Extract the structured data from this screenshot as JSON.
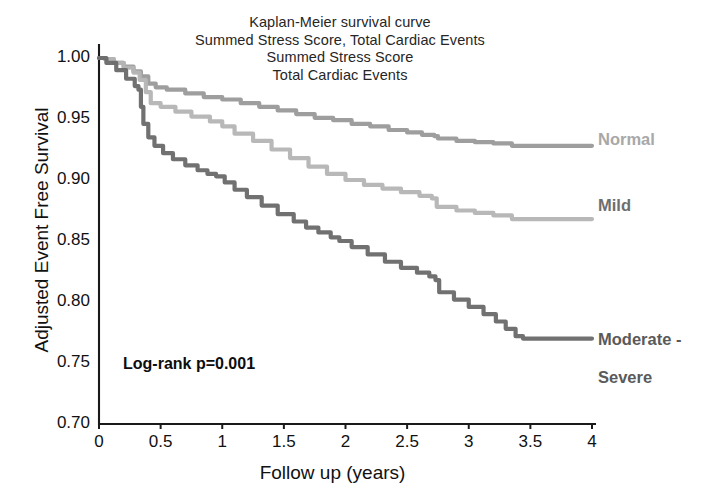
{
  "chart_data": {
    "type": "line",
    "title": "Kaplan-Meier survival curve\nSummed Stress Score, Total Cardiac Events\nSummed Stress Score\nTotal Cardiac Events",
    "title_lines": [
      "Kaplan-Meier survival curve",
      "Summed Stress Score, Total Cardiac Events",
      "Summed Stress Score",
      "Total Cardiac Events"
    ],
    "xlabel": "Follow up (years)",
    "ylabel": "Adjusted Event Free Survival",
    "xlim": [
      0,
      4
    ],
    "ylim": [
      0.7,
      1.0
    ],
    "xticks": [
      0,
      0.5,
      1,
      1.5,
      2,
      2.5,
      3,
      3.5,
      4
    ],
    "xtick_labels": [
      "0",
      "0.5",
      "1",
      "1.5",
      "2",
      "2.5",
      "3",
      "3.5",
      "4"
    ],
    "yticks": [
      1.0,
      0.95,
      0.9,
      0.85,
      0.8,
      0.75,
      0.7
    ],
    "ytick_labels": [
      "1.00",
      "0.95",
      "0.90",
      "0.85",
      "0.80",
      "0.75",
      "0.70"
    ],
    "grid": false,
    "legend_position": "right-inline-labels",
    "annotations": [
      {
        "text": "Log-rank p=0.001",
        "x": 0.25,
        "y": 0.765
      }
    ],
    "series": [
      {
        "name": "Normal",
        "color": "#9a9a9a",
        "label_color": "#a8a8a8",
        "label_text": "Normal",
        "final_value": 0.928,
        "points": [
          [
            0.0,
            1.0
          ],
          [
            0.05,
            0.999
          ],
          [
            0.12,
            0.996
          ],
          [
            0.2,
            0.993
          ],
          [
            0.28,
            0.989
          ],
          [
            0.34,
            0.985
          ],
          [
            0.4,
            0.979
          ],
          [
            0.46,
            0.976
          ],
          [
            0.55,
            0.974
          ],
          [
            0.7,
            0.971
          ],
          [
            0.85,
            0.968
          ],
          [
            1.0,
            0.966
          ],
          [
            1.15,
            0.963
          ],
          [
            1.3,
            0.96
          ],
          [
            1.45,
            0.957
          ],
          [
            1.6,
            0.954
          ],
          [
            1.75,
            0.951
          ],
          [
            1.9,
            0.949
          ],
          [
            2.05,
            0.946
          ],
          [
            2.2,
            0.944
          ],
          [
            2.35,
            0.941
          ],
          [
            2.5,
            0.939
          ],
          [
            2.62,
            0.937
          ],
          [
            2.72,
            0.936
          ],
          [
            2.75,
            0.934
          ],
          [
            2.9,
            0.932
          ],
          [
            3.05,
            0.931
          ],
          [
            3.2,
            0.93
          ],
          [
            3.35,
            0.928
          ],
          [
            3.45,
            0.928
          ],
          [
            3.7,
            0.928
          ],
          [
            4.0,
            0.928
          ]
        ]
      },
      {
        "name": "Mild",
        "color": "#b5b5b5",
        "label_color": "#6e6e6e",
        "label_text": "Mild",
        "final_value": 0.868,
        "points": [
          [
            0.0,
            1.0
          ],
          [
            0.05,
            0.999
          ],
          [
            0.12,
            0.996
          ],
          [
            0.2,
            0.992
          ],
          [
            0.28,
            0.988
          ],
          [
            0.33,
            0.982
          ],
          [
            0.38,
            0.972
          ],
          [
            0.42,
            0.963
          ],
          [
            0.5,
            0.96
          ],
          [
            0.62,
            0.956
          ],
          [
            0.75,
            0.952
          ],
          [
            0.9,
            0.948
          ],
          [
            1.0,
            0.944
          ],
          [
            1.1,
            0.938
          ],
          [
            1.25,
            0.932
          ],
          [
            1.4,
            0.925
          ],
          [
            1.55,
            0.918
          ],
          [
            1.7,
            0.911
          ],
          [
            1.85,
            0.905
          ],
          [
            2.0,
            0.9
          ],
          [
            2.15,
            0.896
          ],
          [
            2.3,
            0.893
          ],
          [
            2.45,
            0.89
          ],
          [
            2.6,
            0.887
          ],
          [
            2.7,
            0.885
          ],
          [
            2.74,
            0.878
          ],
          [
            2.9,
            0.875
          ],
          [
            3.05,
            0.873
          ],
          [
            3.2,
            0.871
          ],
          [
            3.35,
            0.868
          ],
          [
            3.5,
            0.868
          ],
          [
            3.75,
            0.868
          ],
          [
            4.0,
            0.868
          ]
        ]
      },
      {
        "name": "Moderate - Severe",
        "color": "#6b6b6b",
        "label_color": "#5a5a5a",
        "label_text": "Moderate -\nSevere",
        "final_value": 0.77,
        "points": [
          [
            0.0,
            1.0
          ],
          [
            0.06,
            0.996
          ],
          [
            0.14,
            0.99
          ],
          [
            0.22,
            0.983
          ],
          [
            0.29,
            0.977
          ],
          [
            0.32,
            0.974
          ],
          [
            0.34,
            0.96
          ],
          [
            0.36,
            0.946
          ],
          [
            0.4,
            0.935
          ],
          [
            0.45,
            0.928
          ],
          [
            0.52,
            0.922
          ],
          [
            0.6,
            0.917
          ],
          [
            0.7,
            0.912
          ],
          [
            0.8,
            0.908
          ],
          [
            0.88,
            0.905
          ],
          [
            0.95,
            0.903
          ],
          [
            1.02,
            0.898
          ],
          [
            1.1,
            0.892
          ],
          [
            1.2,
            0.886
          ],
          [
            1.32,
            0.879
          ],
          [
            1.45,
            0.872
          ],
          [
            1.58,
            0.866
          ],
          [
            1.68,
            0.861
          ],
          [
            1.78,
            0.857
          ],
          [
            1.88,
            0.853
          ],
          [
            1.95,
            0.85
          ],
          [
            2.05,
            0.845
          ],
          [
            2.18,
            0.839
          ],
          [
            2.32,
            0.833
          ],
          [
            2.45,
            0.828
          ],
          [
            2.58,
            0.824
          ],
          [
            2.68,
            0.821
          ],
          [
            2.73,
            0.818
          ],
          [
            2.76,
            0.808
          ],
          [
            2.88,
            0.802
          ],
          [
            3.0,
            0.796
          ],
          [
            3.12,
            0.79
          ],
          [
            3.22,
            0.784
          ],
          [
            3.3,
            0.778
          ],
          [
            3.38,
            0.772
          ],
          [
            3.44,
            0.77
          ],
          [
            3.6,
            0.77
          ],
          [
            3.8,
            0.77
          ],
          [
            4.0,
            0.77
          ]
        ]
      }
    ]
  },
  "axes": {
    "x_title": "Follow up (years)",
    "y_title": "Adjusted Event Free Survival"
  },
  "annotation": {
    "logrank": "Log-rank p=0.001"
  },
  "labels": {
    "normal": "Normal",
    "mild": "Mild",
    "moderate_severe_line1": "Moderate -",
    "moderate_severe_line2": "Severe"
  },
  "colors": {
    "normal": "#9a9a9a",
    "mild": "#b5b5b5",
    "moderate_severe": "#6b6b6b",
    "axis": "#1a1a1a"
  }
}
